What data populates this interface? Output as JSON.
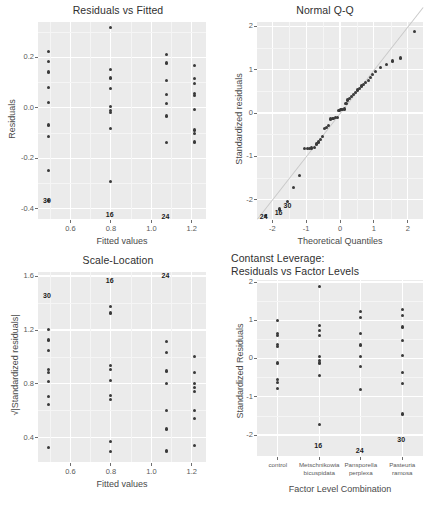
{
  "figure": {
    "type": "diagnostic-plot-grid",
    "rows": 2,
    "cols": 2,
    "panel_bg": "#ebebeb",
    "grid_color": "#ffffff",
    "point_color": "#3a3a3a",
    "refline_color": "#c9c9c9"
  },
  "chart_data": [
    {
      "id": "residuals-vs-fitted",
      "type": "scatter",
      "title": "Residuals vs Fitted",
      "xlabel": "Fitted values",
      "ylabel": "Residuals",
      "xlim": [
        0.44,
        1.27
      ],
      "ylim": [
        -0.44,
        0.34
      ],
      "xticks": [
        0.6,
        0.8,
        1.0,
        1.2
      ],
      "xticklabels": [
        "0.6",
        "0.8",
        "1.0",
        "1.2"
      ],
      "yticks": [
        0.2,
        0.0,
        -0.2,
        -0.4
      ],
      "yticklabels": [
        "0.2",
        "0.0",
        "-0.2",
        "-0.4"
      ],
      "grid": true,
      "points": [
        [
          0.49,
          0.222
        ],
        [
          0.49,
          0.182
        ],
        [
          0.49,
          0.142
        ],
        [
          0.49,
          0.082
        ],
        [
          0.49,
          0.022
        ],
        [
          0.49,
          -0.068
        ],
        [
          0.49,
          -0.113
        ],
        [
          0.49,
          -0.248
        ],
        [
          0.49,
          -0.368
        ],
        [
          0.8,
          0.318
        ],
        [
          0.8,
          0.152
        ],
        [
          0.8,
          0.118
        ],
        [
          0.8,
          0.078
        ],
        [
          0.8,
          0.005
        ],
        [
          0.8,
          -0.012
        ],
        [
          0.8,
          -0.018
        ],
        [
          0.8,
          -0.082
        ],
        [
          0.8,
          -0.292
        ],
        [
          1.075,
          0.212
        ],
        [
          1.075,
          0.178
        ],
        [
          1.075,
          0.108
        ],
        [
          1.075,
          0.052
        ],
        [
          1.075,
          0.018
        ],
        [
          1.075,
          -0.032
        ],
        [
          1.075,
          -0.138
        ],
        [
          1.215,
          0.168
        ],
        [
          1.215,
          0.115
        ],
        [
          1.215,
          0.098
        ],
        [
          1.215,
          0.058
        ],
        [
          1.215,
          0.048
        ],
        [
          1.215,
          -0.005
        ],
        [
          1.215,
          -0.088
        ],
        [
          1.215,
          -0.102
        ],
        [
          1.215,
          -0.135
        ]
      ],
      "annotations": [
        {
          "label": "30",
          "x": 0.49,
          "y": -0.368
        },
        {
          "label": "16",
          "x": 0.8,
          "y": -0.425
        },
        {
          "label": "24",
          "x": 1.075,
          "y": -0.432
        }
      ]
    },
    {
      "id": "normal-qq",
      "type": "scatter",
      "title": "Normal Q-Q",
      "xlabel": "Theoretical Quantiles",
      "ylabel": "Standardized residuals",
      "xlim": [
        -2.45,
        2.45
      ],
      "ylim": [
        -2.45,
        2.1
      ],
      "xticks": [
        -2,
        -1,
        0,
        1,
        2
      ],
      "xticklabels": [
        "-2",
        "-1",
        "0",
        "1",
        "2"
      ],
      "yticks": [
        2,
        1,
        0,
        -1,
        -2
      ],
      "yticklabels": [
        "2",
        "1",
        "0",
        "-1",
        "-2"
      ],
      "grid": true,
      "refline": {
        "slope": 1.0,
        "intercept": 0.0
      },
      "points": [
        [
          -2.2,
          -2.36
        ],
        [
          -1.78,
          -2.22
        ],
        [
          -1.55,
          -2.04
        ],
        [
          -1.38,
          -1.72
        ],
        [
          -1.2,
          -1.44
        ],
        [
          -1.05,
          -0.82
        ],
        [
          -0.96,
          -0.82
        ],
        [
          -0.9,
          -0.82
        ],
        [
          -0.84,
          -0.81
        ],
        [
          -0.76,
          -0.79
        ],
        [
          -0.7,
          -0.72
        ],
        [
          -0.64,
          -0.67
        ],
        [
          -0.58,
          -0.62
        ],
        [
          -0.52,
          -0.55
        ],
        [
          -0.46,
          -0.36
        ],
        [
          -0.4,
          -0.34
        ],
        [
          -0.34,
          -0.29
        ],
        [
          -0.28,
          -0.14
        ],
        [
          -0.23,
          -0.13
        ],
        [
          -0.18,
          -0.12
        ],
        [
          -0.13,
          -0.11
        ],
        [
          -0.08,
          -0.1
        ],
        [
          -0.03,
          0.06
        ],
        [
          0.03,
          0.07
        ],
        [
          0.08,
          0.08
        ],
        [
          0.13,
          0.09
        ],
        [
          0.18,
          0.22
        ],
        [
          0.23,
          0.3
        ],
        [
          0.28,
          0.33
        ],
        [
          0.34,
          0.38
        ],
        [
          0.4,
          0.43
        ],
        [
          0.46,
          0.47
        ],
        [
          0.52,
          0.53
        ],
        [
          0.58,
          0.57
        ],
        [
          0.64,
          0.62
        ],
        [
          0.7,
          0.66
        ],
        [
          0.76,
          0.7
        ],
        [
          0.84,
          0.74
        ],
        [
          0.9,
          0.82
        ],
        [
          0.96,
          0.88
        ],
        [
          1.05,
          0.96
        ],
        [
          1.2,
          1.05
        ],
        [
          1.38,
          1.12
        ],
        [
          1.55,
          1.2
        ],
        [
          1.78,
          1.27
        ],
        [
          2.2,
          1.88
        ]
      ],
      "annotations": [
        {
          "label": "24",
          "x": -2.22,
          "y": -2.4
        },
        {
          "label": "16",
          "x": -1.78,
          "y": -2.32
        },
        {
          "label": "30",
          "x": -1.52,
          "y": -2.14
        }
      ]
    },
    {
      "id": "scale-location",
      "type": "scatter",
      "title": "Scale-Location",
      "xlabel": "Fitted values",
      "ylabel": "√|Standardized residuals|",
      "xlim": [
        0.44,
        1.27
      ],
      "ylim": [
        0.22,
        1.63
      ],
      "xticks": [
        0.6,
        0.8,
        1.0,
        1.2
      ],
      "xticklabels": [
        "0.6",
        "0.8",
        "1.0",
        "1.2"
      ],
      "yticks": [
        1.6,
        1.2,
        0.8,
        0.4
      ],
      "yticklabels": [
        "1.6",
        "1.2",
        "0.8",
        "0.4"
      ],
      "grid": true,
      "points": [
        [
          0.49,
          1.205
        ],
        [
          0.49,
          1.125
        ],
        [
          0.49,
          1.045
        ],
        [
          0.49,
          0.905
        ],
        [
          0.49,
          0.885
        ],
        [
          0.49,
          0.815
        ],
        [
          0.49,
          0.705
        ],
        [
          0.49,
          0.645
        ],
        [
          0.49,
          0.325
        ],
        [
          0.8,
          1.375
        ],
        [
          0.8,
          1.325
        ],
        [
          0.8,
          0.935
        ],
        [
          0.8,
          0.905
        ],
        [
          0.8,
          0.825
        ],
        [
          0.8,
          0.715
        ],
        [
          0.8,
          0.685
        ],
        [
          0.8,
          0.375
        ],
        [
          0.8,
          0.295
        ],
        [
          1.075,
          1.115
        ],
        [
          1.075,
          1.035
        ],
        [
          1.075,
          0.895
        ],
        [
          1.075,
          0.805
        ],
        [
          1.075,
          0.605
        ],
        [
          1.075,
          0.465
        ],
        [
          1.075,
          0.305
        ],
        [
          1.075,
          0.295
        ],
        [
          1.215,
          1.005
        ],
        [
          1.215,
          0.885
        ],
        [
          1.215,
          0.805
        ],
        [
          1.215,
          0.775
        ],
        [
          1.215,
          0.745
        ],
        [
          1.215,
          0.605
        ],
        [
          1.215,
          0.545
        ],
        [
          1.215,
          0.345
        ]
      ],
      "annotations": [
        {
          "label": "30",
          "x": 0.49,
          "y": 1.455
        },
        {
          "label": "16",
          "x": 0.8,
          "y": 1.565
        },
        {
          "label": "24",
          "x": 1.075,
          "y": 1.6
        }
      ]
    },
    {
      "id": "constant-leverage",
      "type": "scatter",
      "title": "Contanst Leverage:\nResiduals vs Factor Levels",
      "xlabel": "Factor Level Combination",
      "ylabel": "Standardized Residuals",
      "categories": [
        "control",
        "Metschnikowia\nbicuspidata",
        "Pansporella\nperplexa",
        "Pasteuria\nramosa"
      ],
      "ylim": [
        -2.55,
        2.05
      ],
      "yticks": [
        2,
        1,
        0,
        -1,
        -2
      ],
      "yticklabels": [
        "2",
        "1",
        "0",
        "-1",
        "-2"
      ],
      "grid": true,
      "series": [
        {
          "name": "control",
          "values": [
            1.0,
            0.65,
            0.6,
            0.37,
            0.32,
            -0.12,
            -0.56,
            -0.62,
            -0.78
          ]
        },
        {
          "name": "Metschnikowia bicuspidata",
          "values": [
            1.88,
            0.87,
            0.72,
            0.6,
            0.04,
            -0.05,
            -0.12,
            -0.45,
            -1.72
          ]
        },
        {
          "name": "Pansporella perplexa",
          "values": [
            1.22,
            1.08,
            0.65,
            0.35,
            0.06,
            -0.22,
            -0.82
          ]
        },
        {
          "name": "Pasteuria ramosa",
          "values": [
            1.27,
            1.12,
            0.82,
            0.47,
            0.08,
            -0.36,
            -0.65,
            -1.45
          ]
        }
      ],
      "annotations": [
        {
          "label": "16",
          "cat": 1,
          "y": -2.3
        },
        {
          "label": "24",
          "cat": 2,
          "y": -2.42
        },
        {
          "label": "30",
          "cat": 3,
          "y": -2.12
        }
      ]
    }
  ]
}
